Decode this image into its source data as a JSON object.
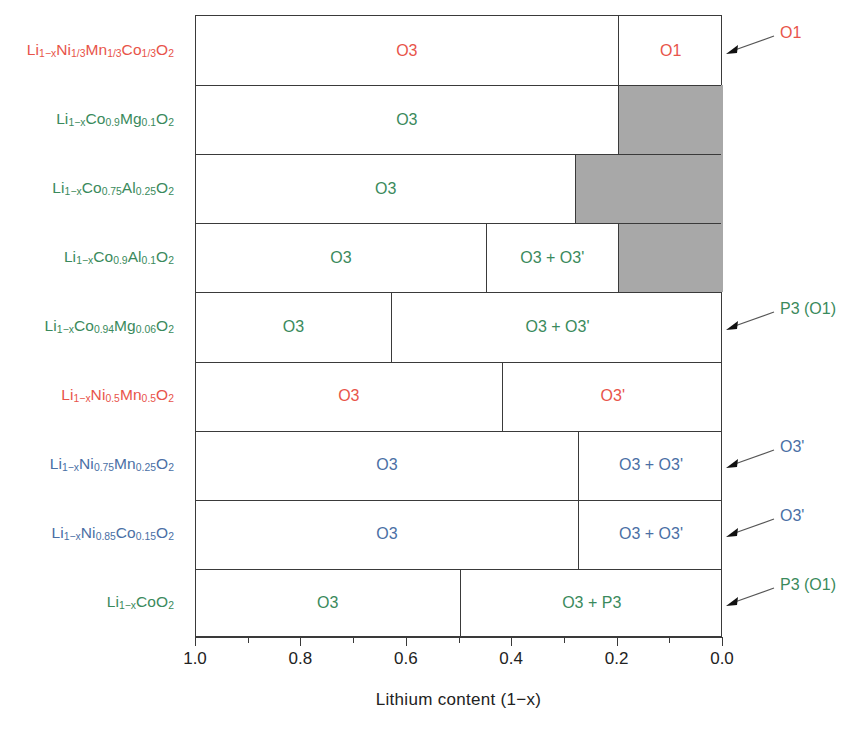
{
  "chart_data": {
    "type": "bar",
    "title": "",
    "xlabel": "Lithium content (1−x)",
    "ylabel": "",
    "xlim": [
      1.0,
      0.0
    ],
    "x_reversed": true,
    "grid": false,
    "legend": "none",
    "tick_labels": [
      "1.0",
      "0.8",
      "0.6",
      "0.4",
      "0.2",
      "0.0"
    ],
    "tick_values": [
      1.0,
      0.8,
      0.6,
      0.4,
      0.2,
      0.0
    ],
    "minor_tick_values": [
      0.9,
      0.7,
      0.5,
      0.3,
      0.1
    ],
    "colors": {
      "red": "#E8544A",
      "green": "#3A8A5C",
      "blue": "#4A6FA5",
      "gray_fill": "#A8A8A8",
      "line": "#3A3A3A"
    },
    "rows": [
      {
        "label": "Li<sub>1−x</sub>Ni<sub>1/3</sub>Mn<sub>1/3</sub>Co<sub>1/3</sub>O<sub>2</sub>",
        "label_plain": "Li1-xNi1/3Mn1/3Co1/3O2",
        "color": "red",
        "segments": [
          {
            "from": 1.0,
            "to": 0.2,
            "phase": "O3",
            "fill": "white"
          },
          {
            "from": 0.2,
            "to": 0.0,
            "phase": "O1",
            "fill": "white"
          }
        ],
        "annotation": {
          "text": "O1",
          "color": "red"
        }
      },
      {
        "label": "Li<sub>1−x</sub>Co<sub>0.9</sub>Mg<sub>0.1</sub>O<sub>2</sub>",
        "label_plain": "Li1-xCo0.9Mg0.1O2",
        "color": "green",
        "segments": [
          {
            "from": 1.0,
            "to": 0.2,
            "phase": "O3",
            "fill": "white"
          },
          {
            "from": 0.2,
            "to": 0.0,
            "phase": "",
            "fill": "gray"
          }
        ],
        "annotation": null
      },
      {
        "label": "Li<sub>1−x</sub>Co<sub>0.75</sub>Al<sub>0.25</sub>O<sub>2</sub>",
        "label_plain": "Li1-xCo0.75Al0.25O2",
        "color": "green",
        "segments": [
          {
            "from": 1.0,
            "to": 0.28,
            "phase": "O3",
            "fill": "white"
          },
          {
            "from": 0.28,
            "to": 0.0,
            "phase": "",
            "fill": "gray"
          }
        ],
        "annotation": null
      },
      {
        "label": "Li<sub>1−x</sub>Co<sub>0.9</sub>Al<sub>0.1</sub>O<sub>2</sub>",
        "label_plain": "Li1-xCo0.9Al0.1O2",
        "color": "green",
        "segments": [
          {
            "from": 1.0,
            "to": 0.45,
            "phase": "O3",
            "fill": "white"
          },
          {
            "from": 0.45,
            "to": 0.2,
            "phase": "O3 + O3'",
            "fill": "white"
          },
          {
            "from": 0.2,
            "to": 0.0,
            "phase": "",
            "fill": "gray"
          }
        ],
        "annotation": null
      },
      {
        "label": "Li<sub>1−x</sub>Co<sub>0.94</sub>Mg<sub>0.06</sub>O<sub>2</sub>",
        "label_plain": "Li1-xCo0.94Mg0.06O2",
        "color": "green",
        "segments": [
          {
            "from": 1.0,
            "to": 0.63,
            "phase": "O3",
            "fill": "white"
          },
          {
            "from": 0.63,
            "to": 0.0,
            "phase": "O3 + O3'",
            "fill": "white"
          }
        ],
        "annotation": {
          "text": "P3 (O1)",
          "color": "green"
        }
      },
      {
        "label": "Li<sub>1−x</sub>Ni<sub>0.5</sub>Mn<sub>0.5</sub>O<sub>2</sub>",
        "label_plain": "Li1-xNi0.5Mn0.5O2",
        "color": "red",
        "segments": [
          {
            "from": 1.0,
            "to": 0.42,
            "phase": "O3",
            "fill": "white"
          },
          {
            "from": 0.42,
            "to": 0.0,
            "phase": "O3'",
            "fill": "white"
          }
        ],
        "annotation": null
      },
      {
        "label": "Li<sub>1−x</sub>Ni<sub>0.75</sub>Mn<sub>0.25</sub>O<sub>2</sub>",
        "label_plain": "Li1-xNi0.75Mn0.25O2",
        "color": "blue",
        "segments": [
          {
            "from": 1.0,
            "to": 0.275,
            "phase": "O3",
            "fill": "white"
          },
          {
            "from": 0.275,
            "to": 0.0,
            "phase": "O3 + O3'",
            "fill": "white"
          }
        ],
        "annotation": {
          "text": "O3'",
          "color": "blue"
        }
      },
      {
        "label": "Li<sub>1−x</sub>Ni<sub>0.85</sub>Co<sub>0.15</sub>O<sub>2</sub>",
        "label_plain": "Li1-xNi0.85Co0.15O2",
        "color": "blue",
        "segments": [
          {
            "from": 1.0,
            "to": 0.275,
            "phase": "O3",
            "fill": "white"
          },
          {
            "from": 0.275,
            "to": 0.0,
            "phase": "O3 + O3'",
            "fill": "white"
          }
        ],
        "annotation": {
          "text": "O3'",
          "color": "blue"
        }
      },
      {
        "label": "Li<sub>1−x</sub>CoO<sub>2</sub>",
        "label_plain": "Li1-xCoO2",
        "color": "green",
        "segments": [
          {
            "from": 1.0,
            "to": 0.5,
            "phase": "O3",
            "fill": "white"
          },
          {
            "from": 0.5,
            "to": 0.0,
            "phase": "O3 + P3",
            "fill": "white"
          }
        ],
        "annotation": {
          "text": "P3 (O1)",
          "color": "green"
        }
      }
    ]
  }
}
